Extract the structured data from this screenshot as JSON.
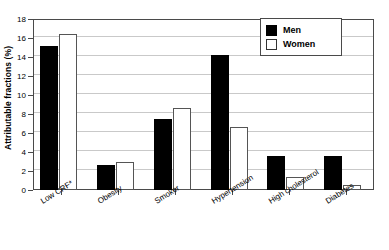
{
  "chart_data": {
    "type": "bar",
    "title": "",
    "subtitle": "",
    "xlabel": "",
    "ylabel": "Attributable fractions (%)",
    "ylim": [
      0,
      18
    ],
    "ytick_step": 2,
    "yticks": [
      "0",
      "2",
      "4",
      "6",
      "8",
      "10",
      "12",
      "14",
      "16",
      "18"
    ],
    "grid": true,
    "grid_axis": "y",
    "legend_position": "top-right",
    "categories": [
      "Low CRF*",
      "Obesity",
      "Smoker",
      "Hypertension",
      "High cholesterol",
      "Diabetes"
    ],
    "series": [
      {
        "name": "Men",
        "color": "#000000",
        "values": [
          15.2,
          2.6,
          7.5,
          14.2,
          3.6,
          3.6
        ]
      },
      {
        "name": "Women",
        "color": "#ffffff",
        "values": [
          16.4,
          2.9,
          8.6,
          6.6,
          1.4,
          0.5
        ]
      }
    ],
    "annotations": [
      "* Low CRF denoted by asterisk in category label"
    ]
  },
  "legend": {
    "items": [
      {
        "label": "Men",
        "swatch": "filled-black-square"
      },
      {
        "label": "Women",
        "swatch": "open-white-square"
      }
    ]
  },
  "colors": {
    "men": "#000000",
    "women": "#ffffff",
    "axis": "#4a4a4a",
    "grid": "#c9c9c9",
    "background": "#ffffff"
  }
}
